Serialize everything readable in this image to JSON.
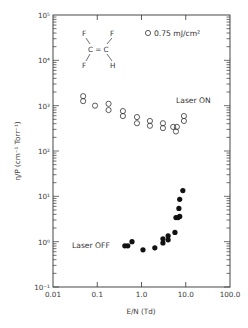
{
  "chart_data": {
    "type": "scatter",
    "title": "",
    "xlabel": "E/N (Td)",
    "ylabel": "η/P (cm⁻¹ Torr⁻¹)",
    "xscale": "log",
    "yscale": "log",
    "xlim": [
      0.01,
      100.0
    ],
    "ylim": [
      0.1,
      100000
    ],
    "x_ticks": [
      "0.01",
      "0.1",
      "1.0",
      "10.0",
      "100.0"
    ],
    "y_ticks": [
      "10⁻¹",
      "10⁰",
      "10¹",
      "10²",
      "10³",
      "10⁴",
      "10⁵"
    ],
    "grid": false,
    "legend": {
      "position": "upper right",
      "entries": [
        "○ 0.75 mJ/cm²"
      ]
    },
    "annotations": [
      "Laser ON",
      "Laser OFF",
      "F2C=CFH structure (F, F / C = C / F, H)"
    ],
    "series": [
      {
        "name": "Laser ON",
        "marker": "open-circle",
        "x": [
          0.048,
          0.048,
          0.089,
          0.18,
          0.18,
          0.38,
          0.38,
          0.79,
          0.79,
          1.55,
          1.55,
          3.05,
          3.05,
          5.2,
          6.0,
          6.3,
          9.1,
          9.1
        ],
        "y": [
          1620,
          1260,
          1000,
          1100,
          800,
          760,
          590,
          560,
          410,
          460,
          360,
          410,
          320,
          340,
          270,
          340,
          590,
          460
        ]
      },
      {
        "name": "Laser OFF",
        "marker": "filled-circle",
        "x": [
          0.42,
          0.49,
          0.61,
          1.08,
          2.0,
          3.05,
          3.05,
          4.0,
          4.0,
          5.7,
          6.0,
          6.7,
          7.3,
          7.0,
          7.3,
          8.6
        ],
        "y": [
          0.81,
          0.81,
          1.0,
          0.66,
          0.73,
          1.16,
          0.94,
          1.35,
          1.1,
          1.6,
          3.4,
          3.4,
          3.6,
          5.4,
          8.6,
          13.4
        ]
      }
    ]
  },
  "labels": {
    "x_axis_title": "E/N (Td)",
    "y_axis_title": "η/P (cm⁻¹ Torr⁻¹)",
    "legend": "0.75 mJ/cm²",
    "laser_on": "Laser ON",
    "laser_off": "Laser OFF",
    "molecule": {
      "tl": "F",
      "tr": "F",
      "bl": "F",
      "br": "H",
      "center": "C = C"
    }
  }
}
